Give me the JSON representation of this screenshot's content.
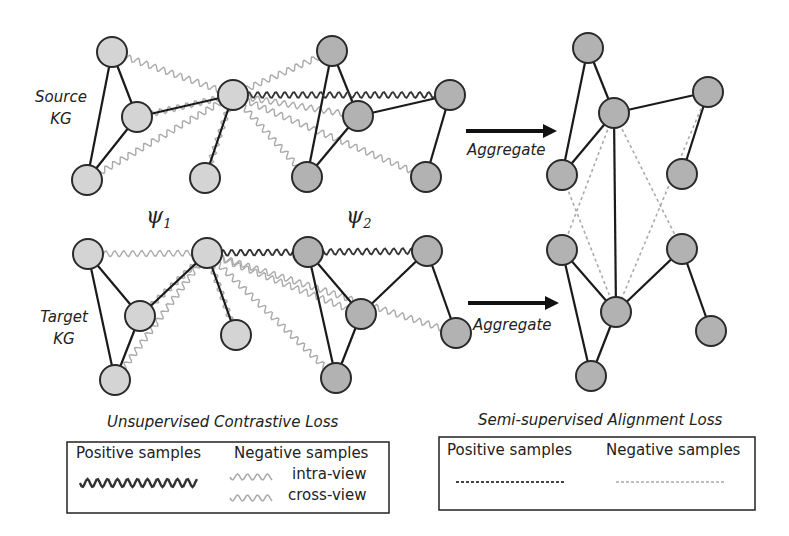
{
  "labels": {
    "source_kg_line1": "Source",
    "source_kg_line2": "KG",
    "target_kg_line1": "Target",
    "target_kg_line2": "KG",
    "psi1_base": "ψ",
    "psi1_sub": "1",
    "psi2_base": "ψ",
    "psi2_sub": "2",
    "aggregate_top": "Aggregate",
    "aggregate_bottom": "Aggregate"
  },
  "legend_unsupervised": {
    "title": "Unsupervised Contrastive Loss",
    "positive_label": "Positive samples",
    "negative_label": "Negative samples",
    "intra_view": "intra-view",
    "cross_view": "cross-view"
  },
  "legend_semisupervised": {
    "title": "Semi-supervised Alignment Loss",
    "positive_label": "Positive samples",
    "negative_label": "Negative samples"
  },
  "colors": {
    "view1_node": "#d4d4d4",
    "view2_node": "#b2b2b2",
    "edge": "#1a1a1a",
    "positive_wave": "#333333",
    "negative_wave": "#aaaaaa",
    "positive_dash": "#555555",
    "negative_dash": "#aaaaaa"
  },
  "graphs": {
    "source_view1": [
      [
        112,
        52
      ],
      [
        137,
        117
      ],
      [
        87,
        180
      ],
      [
        233,
        95
      ],
      [
        205,
        178
      ]
    ],
    "source_view2": [
      [
        332,
        51
      ],
      [
        358,
        116
      ],
      [
        307,
        177
      ],
      [
        450,
        95
      ],
      [
        426,
        177
      ]
    ],
    "target_view1": [
      [
        88,
        254
      ],
      [
        140,
        316
      ],
      [
        115,
        380
      ],
      [
        207,
        253
      ],
      [
        236,
        335
      ]
    ],
    "target_view2": [
      [
        308,
        252
      ],
      [
        361,
        314
      ],
      [
        336,
        378
      ],
      [
        427,
        251
      ],
      [
        456,
        333
      ]
    ],
    "aggregated_source": [
      [
        588,
        48
      ],
      [
        614,
        113
      ],
      [
        562,
        175
      ],
      [
        708,
        92
      ],
      [
        682,
        174
      ]
    ],
    "aggregated_target": [
      [
        562,
        250
      ],
      [
        616,
        312
      ],
      [
        591,
        376
      ],
      [
        682,
        249
      ],
      [
        711,
        331
      ]
    ]
  }
}
